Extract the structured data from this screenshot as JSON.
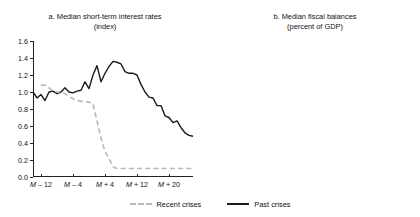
{
  "legend": {
    "position": "bottom-center",
    "items": [
      {
        "label": "Recent crises",
        "style": "dashed",
        "color": "#b9b9b9"
      },
      {
        "label": "Past crises",
        "style": "solid",
        "color": "#1a1a1a"
      }
    ]
  },
  "chart_data": [
    {
      "type": "line",
      "panel": "a",
      "title": "a. Median short-term interest rates",
      "subtitle": "(index)",
      "xlabel": "",
      "ylabel": "",
      "ylim": [
        0.0,
        1.6
      ],
      "yticks": [
        "0.0",
        "0.2",
        "0.4",
        "0.6",
        "0.8",
        "1.0",
        "1.2",
        "1.4",
        "1.6"
      ],
      "ytickvalues": [
        0.0,
        0.2,
        0.4,
        0.6,
        0.8,
        1.0,
        1.2,
        1.4,
        1.6
      ],
      "xlim": [
        -14,
        26
      ],
      "xticks": [
        "M – 12",
        "M – 4",
        "M + 4",
        "M + 12",
        "M + 20"
      ],
      "xtickvalues": [
        -12,
        -4,
        4,
        12,
        20
      ],
      "grid": false,
      "x": [
        -14,
        -13,
        -12,
        -11,
        -10,
        -9,
        -8,
        -7,
        -6,
        -5,
        -4,
        -3,
        -2,
        -1,
        0,
        1,
        2,
        3,
        4,
        5,
        6,
        7,
        8,
        9,
        10,
        11,
        12,
        13,
        14,
        15,
        16,
        17,
        18,
        19,
        20,
        21,
        22,
        23,
        24,
        25,
        26
      ],
      "series": [
        {
          "name": "Past crises",
          "style": "solid",
          "color": "#1a1a1a",
          "values": [
            1.0,
            0.93,
            0.97,
            0.9,
            1.0,
            1.01,
            0.98,
            1.0,
            1.05,
            1.0,
            0.99,
            1.01,
            1.02,
            1.12,
            1.04,
            1.2,
            1.31,
            1.12,
            1.22,
            1.3,
            1.36,
            1.35,
            1.33,
            1.24,
            1.22,
            1.22,
            1.2,
            1.09,
            1.0,
            0.94,
            0.93,
            0.84,
            0.84,
            0.72,
            0.7,
            0.64,
            0.66,
            0.58,
            0.52,
            0.49,
            0.48
          ]
        },
        {
          "name": "Recent crises",
          "style": "dashed",
          "color": "#b9b9b9",
          "values": [
            null,
            null,
            1.08,
            1.08,
            1.05,
            1.01,
            1.0,
            1.0,
            0.98,
            0.95,
            0.92,
            0.9,
            0.89,
            0.89,
            0.88,
            0.86,
            0.66,
            0.46,
            0.3,
            0.22,
            0.12,
            0.1,
            0.1,
            0.1,
            0.1,
            0.1,
            0.1,
            0.1,
            0.1,
            0.1,
            0.1,
            0.1,
            0.1,
            0.1,
            0.1,
            0.1,
            0.1,
            0.1,
            0.1,
            0.1,
            0.1
          ]
        }
      ]
    },
    {
      "type": "line",
      "panel": "b",
      "title": "b. Median fiscal balances",
      "subtitle": "(percent of GDP)",
      "xlabel": "",
      "ylabel": "",
      "ylim": [
        -8,
        1
      ],
      "yticks": [
        "1",
        "0",
        "–1",
        "–2",
        "–3",
        "–4",
        "–5",
        "–6",
        "–7",
        "–8"
      ],
      "ytickvalues": [
        1,
        0,
        -1,
        -2,
        -3,
        -4,
        -5,
        -6,
        -7,
        -8
      ],
      "xticks": [
        "Y – 2",
        "Y – 1",
        "Y",
        "Y + 1",
        "Y + 2"
      ],
      "xtickvalues": [
        -2,
        -1,
        0,
        1,
        2
      ],
      "grid": false,
      "x": [
        -2,
        -1,
        0,
        1,
        2
      ],
      "series": [
        {
          "name": "Past crises",
          "style": "solid",
          "color": "#1a1a1a",
          "values": [
            -1.5,
            -0.95,
            -3.5,
            -4.9,
            -2.75
          ]
        },
        {
          "name": "Recent crises",
          "style": "dashed",
          "color": "#b9b9b9",
          "values": [
            -0.2,
            -0.05,
            -1.1,
            -5.3,
            -5.85
          ]
        }
      ]
    }
  ]
}
